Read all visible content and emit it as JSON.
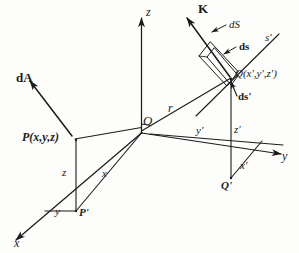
{
  "figure": {
    "ink_color": "#1b1b1b",
    "background_color": "#fdfdfb",
    "width": 299,
    "height": 253
  },
  "labels": {
    "axis_z": "z",
    "axis_y": "y",
    "axis_x": "x",
    "origin": "O",
    "point_p": "P(x,y,z)",
    "point_p_prime": "P'",
    "leg_z": "z",
    "leg_x": "x",
    "leg_y": "y",
    "vector_r": "r",
    "vector_dA": "dA",
    "vector_K": "K",
    "elem_dS": "dS",
    "elem_ds": "ds",
    "elem_ds_prime": "ds'",
    "point_q": "Q(x',y',z')",
    "point_q_prime": "Q'",
    "axis_s_prime": "s'",
    "axis_z_prime": "z'",
    "axis_y_prime": "y'",
    "axis_x_prime": "x'"
  }
}
